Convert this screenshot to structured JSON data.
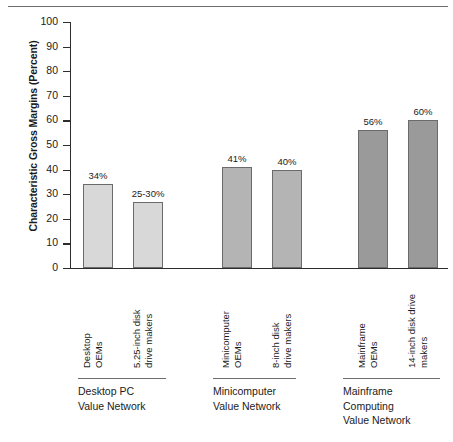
{
  "chart_data": {
    "type": "bar",
    "title": "",
    "xlabel": "",
    "ylabel": "Characteristic Gross Margins (Percent)",
    "ylim": [
      0,
      100
    ],
    "ytick_step": 10,
    "yticks": [
      "100",
      "90",
      "80",
      "70",
      "60",
      "50",
      "40",
      "30",
      "20",
      "10",
      "0"
    ],
    "grid": false,
    "legend": "none",
    "categories": [
      "Desktop OEMs",
      "5.25-inch disk drive makers",
      "Minicomputer OEMs",
      "8-inch disk drive makers",
      "Mainframe OEMs",
      "14-inch disk drive makers"
    ],
    "values": [
      34,
      27,
      41,
      40,
      56,
      60
    ],
    "value_labels": [
      "34%",
      "25-30%",
      "41%",
      "40%",
      "56%",
      "60%"
    ],
    "groups": [
      {
        "label": "Desktop PC Value Network",
        "lines": [
          "Desktop PC",
          "Value Network"
        ],
        "members": [
          0,
          1
        ]
      },
      {
        "label": "Minicomputer Value Network",
        "lines": [
          "Minicomputer",
          "Value Network"
        ],
        "members": [
          2,
          3
        ]
      },
      {
        "label": "Mainframe Computing Value Network",
        "lines": [
          "Mainframe",
          "Computing",
          "Value Network"
        ],
        "members": [
          4,
          5
        ]
      }
    ],
    "bar_colors": [
      "#d8d8d8",
      "#d8d8d8",
      "#b4b4b4",
      "#b4b4b4",
      "#9a9a9a",
      "#9a9a9a"
    ]
  },
  "axis": {
    "y_title": "Characteristic Gross Margins (Percent)",
    "ticks": [
      {
        "value": "100"
      },
      {
        "value": "90"
      },
      {
        "value": "80"
      },
      {
        "value": "70"
      },
      {
        "value": "60"
      },
      {
        "value": "50"
      },
      {
        "value": "40"
      },
      {
        "value": "30"
      },
      {
        "value": "20"
      },
      {
        "value": "10"
      },
      {
        "value": "0"
      }
    ]
  },
  "bars": [
    {
      "value_label": "34%",
      "cat_line1": "Desktop",
      "cat_line2": "OEMs"
    },
    {
      "value_label": "25-30%",
      "cat_line1": "5.25-inch disk",
      "cat_line2": "drive makers"
    },
    {
      "value_label": "41%",
      "cat_line1": "Minicomputer",
      "cat_line2": "OEMs"
    },
    {
      "value_label": "40%",
      "cat_line1": "8-inch disk",
      "cat_line2": "drive makers"
    },
    {
      "value_label": "56%",
      "cat_line1": "Mainframe",
      "cat_line2": "OEMs"
    },
    {
      "value_label": "60%",
      "cat_line1": "14-inch disk drive",
      "cat_line2": "makers"
    }
  ],
  "groups": [
    {
      "line1": "Desktop PC",
      "line2": "Value Network",
      "line3": ""
    },
    {
      "line1": "Minicomputer",
      "line2": "Value Network",
      "line3": ""
    },
    {
      "line1": "Mainframe",
      "line2": "Computing",
      "line3": "Value Network"
    }
  ],
  "colors": {
    "bar_light": "#d8d8d8",
    "bar_mid": "#b4b4b4",
    "bar_dark": "#9a9a9a",
    "axis": "#2d2d2d",
    "rule": "#6e6e6e",
    "text": "#1b1b1b"
  }
}
